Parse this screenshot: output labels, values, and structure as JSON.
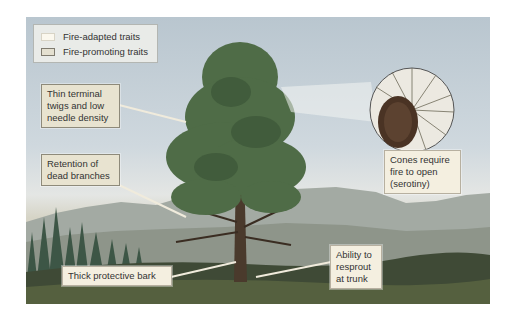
{
  "legend": {
    "items": [
      {
        "label": "Fire-adapted traits",
        "swatch_color": "#fbf8ee",
        "border_color": "#d8d4c6"
      },
      {
        "label": "Fire-promoting traits",
        "swatch_color": "#e4e0d0",
        "border_color": "#7f7b6f"
      }
    ]
  },
  "labels": {
    "twigs": "Thin terminal twigs and low needle density",
    "dead_branches": "Retention of dead branches",
    "cones": "Cones require fire to open (serotiny)",
    "bark": "Thick protective bark",
    "resprout": "Ability to resprout at trunk"
  },
  "colors": {
    "sky": "#c3ced6",
    "mountains": "#9aa19c",
    "forest": "#3f5a48",
    "tree_foliage": "#4d6b45",
    "trunk": "#4a3a2c",
    "ground": "#3c4634",
    "cone": "#4a3324"
  }
}
